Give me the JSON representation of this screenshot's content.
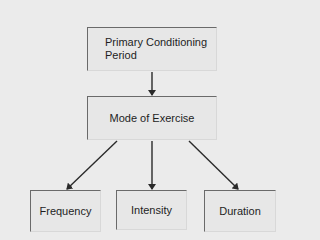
{
  "diagram": {
    "type": "flowchart",
    "background": "#ebebeb",
    "nodes": [
      {
        "id": "primary",
        "label_line1": "Primary Conditioning",
        "label_line2": "Period"
      },
      {
        "id": "mode",
        "label": "Mode of Exercise"
      },
      {
        "id": "frequency",
        "label": "Frequency"
      },
      {
        "id": "intensity",
        "label": "Intensity"
      },
      {
        "id": "duration",
        "label": "Duration"
      }
    ],
    "edges": [
      {
        "from": "primary",
        "to": "mode"
      },
      {
        "from": "mode",
        "to": "frequency"
      },
      {
        "from": "mode",
        "to": "intensity"
      },
      {
        "from": "mode",
        "to": "duration"
      }
    ],
    "colors": {
      "box_fill": "#e7e7e7",
      "box_border": "#6a6a6a",
      "arrow": "#2a2a2a"
    }
  }
}
